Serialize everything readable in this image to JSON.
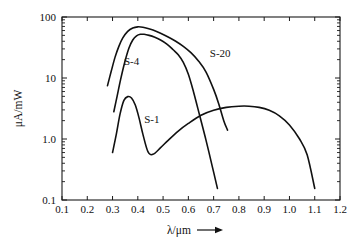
{
  "chart_data": {
    "type": "line",
    "title": "",
    "subtitle": "",
    "xlabel": "λ/μm",
    "xlabel_arrow": "⟶",
    "ylabel": "μA/mW",
    "xscale": "linear",
    "yscale": "log",
    "xlim": [
      0.1,
      1.2
    ],
    "ylim": [
      0.1,
      100
    ],
    "grid": false,
    "legend_position": "inline-annotations",
    "xticks": [
      0.1,
      0.2,
      0.3,
      0.4,
      0.5,
      0.6,
      0.7,
      0.8,
      0.9,
      1.0,
      1.1,
      1.2
    ],
    "xticklabels": [
      "0.1",
      "0.2",
      "0.3",
      "0.4",
      "0.5",
      "0.6",
      "0.7",
      "0.8",
      "0.9",
      "1.0",
      "1.1",
      "1.2"
    ],
    "yticks": [
      0.1,
      1.0,
      10,
      100
    ],
    "yticklabels": [
      "0.1",
      "1.0",
      "10",
      "100"
    ],
    "yminorticks": [
      0.2,
      0.3,
      0.4,
      0.5,
      0.6,
      0.7,
      0.8,
      0.9,
      2,
      3,
      4,
      5,
      6,
      7,
      8,
      9,
      20,
      30,
      40,
      50,
      60,
      70,
      80,
      90
    ],
    "series": [
      {
        "name": "S-20",
        "label": "S-20",
        "label_x": 0.685,
        "label_y": 22.0,
        "x": [
          0.28,
          0.295,
          0.31,
          0.325,
          0.34,
          0.36,
          0.38,
          0.4,
          0.42,
          0.44,
          0.46,
          0.49,
          0.52,
          0.55,
          0.58,
          0.61,
          0.64,
          0.67,
          0.7,
          0.72,
          0.74,
          0.755
        ],
        "y": [
          7.5,
          13.0,
          22.0,
          33.0,
          45.0,
          58.0,
          66.0,
          69.0,
          68.0,
          65.0,
          61.0,
          54.0,
          47.0,
          40.0,
          33.0,
          26.0,
          19.0,
          12.5,
          6.5,
          3.8,
          2.0,
          1.4
        ]
      },
      {
        "name": "S-4",
        "label": "S-4",
        "label_x": 0.345,
        "label_y": 16.5,
        "x": [
          0.305,
          0.318,
          0.332,
          0.348,
          0.365,
          0.38,
          0.395,
          0.41,
          0.425,
          0.445,
          0.465,
          0.49,
          0.515,
          0.54,
          0.56,
          0.58,
          0.6,
          0.62,
          0.645,
          0.67,
          0.695,
          0.715
        ],
        "y": [
          2.8,
          5.0,
          9.5,
          18.0,
          31.0,
          42.0,
          49.0,
          52.0,
          52.0,
          50.0,
          47.0,
          42.0,
          36.0,
          29.0,
          24.0,
          18.0,
          11.5,
          6.0,
          2.4,
          0.95,
          0.35,
          0.155
        ]
      },
      {
        "name": "S-1",
        "label": "S-1",
        "label_x": 0.425,
        "label_y": 1.85,
        "x": [
          0.3,
          0.315,
          0.33,
          0.345,
          0.36,
          0.375,
          0.39,
          0.405,
          0.42,
          0.44,
          0.46,
          0.49,
          0.52,
          0.56,
          0.6,
          0.65,
          0.7,
          0.75,
          0.8,
          0.84,
          0.88,
          0.92,
          0.96,
          1.0,
          1.04,
          1.07,
          1.1
        ],
        "y": [
          0.6,
          1.2,
          2.6,
          4.3,
          4.95,
          4.7,
          3.6,
          2.2,
          1.2,
          0.62,
          0.56,
          0.72,
          0.95,
          1.35,
          1.8,
          2.45,
          2.95,
          3.3,
          3.45,
          3.45,
          3.3,
          2.95,
          2.4,
          1.7,
          1.0,
          0.55,
          0.155
        ]
      }
    ]
  },
  "plot_geometry": {
    "left": 62,
    "right": 340,
    "top": 17,
    "bottom": 200
  }
}
